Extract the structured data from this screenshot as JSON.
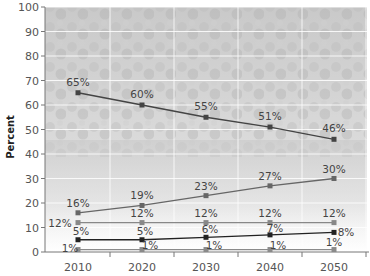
{
  "chart_data": {
    "type": "line",
    "title": "",
    "xlabel": "",
    "ylabel": "Percent",
    "ylim": [
      0,
      100
    ],
    "yticks": [
      0,
      10,
      20,
      30,
      40,
      50,
      60,
      70,
      80,
      90,
      100
    ],
    "categories": [
      "2010",
      "2020",
      "2030",
      "2040",
      "2050"
    ],
    "grid": true,
    "background": "faded crowd photo",
    "series": [
      {
        "name": "series-1",
        "values": [
          65,
          60,
          55,
          51,
          46
        ],
        "labels": [
          "65%",
          "60%",
          "55%",
          "51%",
          "46%"
        ],
        "color": "#444444"
      },
      {
        "name": "series-2",
        "values": [
          16,
          19,
          23,
          27,
          30
        ],
        "labels": [
          "16%",
          "19%",
          "23%",
          "27%",
          "30%"
        ],
        "color": "#666666"
      },
      {
        "name": "series-3",
        "values": [
          12,
          12,
          12,
          12,
          12
        ],
        "labels": [
          "12%",
          "12%",
          "12%",
          "12%",
          "12%"
        ],
        "color": "#888888"
      },
      {
        "name": "series-4",
        "values": [
          5,
          5,
          6,
          7,
          8
        ],
        "labels": [
          "5%",
          "5%",
          "6%",
          "7%",
          "8%"
        ],
        "color": "#222222"
      },
      {
        "name": "series-5",
        "values": [
          1,
          1,
          1,
          1,
          1
        ],
        "labels": [
          "1%",
          "1%",
          "1%",
          "1%",
          "1%"
        ],
        "color": "#8a8a8a"
      }
    ]
  }
}
